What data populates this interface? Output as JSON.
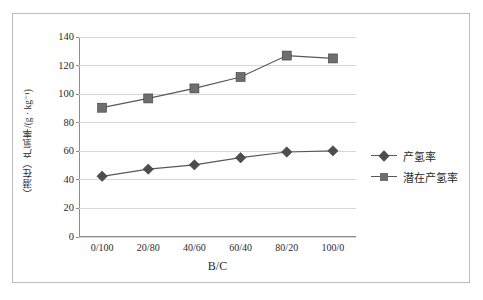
{
  "chart_data": {
    "type": "line",
    "title": "",
    "xlabel": "B/C",
    "ylabel": "（潜在）产氢率/(g · kg⁻¹)",
    "categories": [
      "0/100",
      "20/80",
      "40/60",
      "60/40",
      "80/20",
      "100/0"
    ],
    "ylim": [
      0,
      140
    ],
    "yticks": [
      0,
      20,
      40,
      60,
      80,
      100,
      120,
      140
    ],
    "ytick_labels": [
      "0",
      "20",
      "40",
      "60",
      "80",
      "100",
      "120",
      "140"
    ],
    "grid": true,
    "legend_position": "right",
    "series": [
      {
        "name": "产氢率",
        "marker": "diamond",
        "color": "#4d4d4d",
        "line_color": "#585858",
        "values": [
          42.5,
          47.5,
          50.5,
          55.5,
          59.5,
          60.3
        ]
      },
      {
        "name": "潜在产氢率",
        "marker": "square",
        "color": "#6e6e6e",
        "line_color": "#585858",
        "values": [
          90.5,
          97.0,
          104.0,
          112.0,
          127.0,
          125.0
        ]
      }
    ]
  },
  "legend": {
    "items": [
      {
        "label": "产氢率",
        "marker": "diamond"
      },
      {
        "label": "潜在产氢率",
        "marker": "square"
      }
    ]
  },
  "caption": {
    "text": ""
  },
  "colors": {
    "frame": "#bdbdbd",
    "grid": "#d6d6d6",
    "axis": "#8c8c8c",
    "text": "#2b2b2b"
  }
}
